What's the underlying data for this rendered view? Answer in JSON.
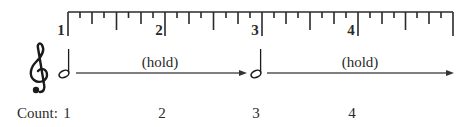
{
  "ruler": {
    "beat_labels": [
      "1",
      "2",
      "3",
      "4"
    ],
    "subdivisions_per_beat": 8
  },
  "staff": {
    "clef": "treble-clef",
    "notes": [
      {
        "type": "half-note",
        "beat": "1"
      },
      {
        "type": "half-note",
        "beat": "3"
      }
    ],
    "holds": [
      {
        "label": "(hold)"
      },
      {
        "label": "(hold)"
      }
    ]
  },
  "count": {
    "label": "Count:",
    "numbers": [
      "1",
      "2",
      "3",
      "4"
    ]
  },
  "colors": {
    "ink": "#2a2a2a",
    "arrow": "#555555"
  }
}
